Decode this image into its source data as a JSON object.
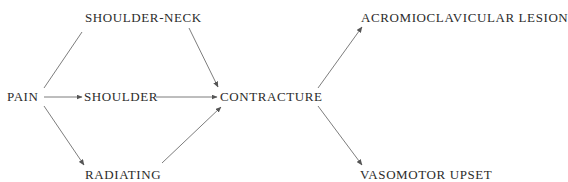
{
  "diagram": {
    "type": "flow",
    "nodes": {
      "pain": {
        "label": "PAIN",
        "x": 7,
        "y": 90
      },
      "shoulder_neck": {
        "label": "SHOULDER-NECK",
        "x": 85,
        "y": 11
      },
      "shoulder": {
        "label": "SHOULDER",
        "x": 84,
        "y": 90
      },
      "radiating": {
        "label": "RADIATING",
        "x": 85,
        "y": 168
      },
      "contracture": {
        "label": "CONTRACTURE",
        "x": 220,
        "y": 90
      },
      "acromioclavicular_lesion": {
        "label": "ACROMIOCLAVICULAR LESION",
        "x": 361,
        "y": 11
      },
      "vasomotor_upset": {
        "label": "VASOMOTOR UPSET",
        "x": 360,
        "y": 168
      }
    },
    "edges": [
      {
        "from": "PAIN",
        "to": "SHOULDER-NECK",
        "arrow": false
      },
      {
        "from": "PAIN",
        "to": "SHOULDER",
        "arrow": true
      },
      {
        "from": "PAIN",
        "to": "RADIATING",
        "arrow": true
      },
      {
        "from": "SHOULDER-NECK",
        "to": "CONTRACTURE",
        "arrow": true
      },
      {
        "from": "SHOULDER",
        "to": "CONTRACTURE",
        "arrow": true
      },
      {
        "from": "RADIATING",
        "to": "CONTRACTURE",
        "arrow": true
      },
      {
        "from": "CONTRACTURE",
        "to": "ACROMIOCLAVICULAR LESION",
        "arrow": true
      },
      {
        "from": "CONTRACTURE",
        "to": "VASOMOTOR UPSET",
        "arrow": true
      }
    ],
    "colors": {
      "text": "#2b2b2b",
      "line": "#6e6e6e",
      "background": "#ffffff"
    }
  }
}
